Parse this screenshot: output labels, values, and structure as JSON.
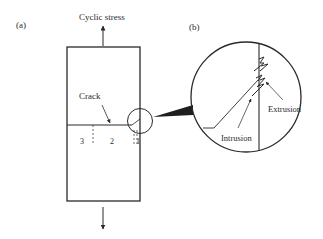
{
  "panel_a": {
    "label": "(a)",
    "stress_label": "Cyclic stress",
    "crack_label": "Crack",
    "stage_labels": [
      "3",
      "2",
      "1"
    ]
  },
  "panel_b": {
    "label": "(b)",
    "intrusion_label": "Intrusion",
    "extrusion_label": "Extrusion"
  },
  "colors": {
    "line": "#2a2a2a",
    "background": "#ffffff"
  }
}
